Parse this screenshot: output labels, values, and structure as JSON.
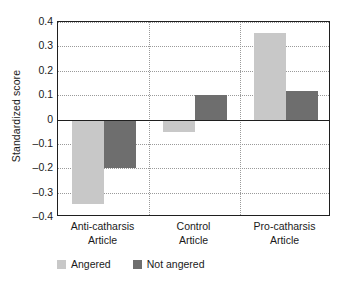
{
  "chart_data": {
    "type": "bar",
    "title": "",
    "xlabel": "",
    "ylabel": "Standardized score",
    "ylim": [
      -0.4,
      0.4
    ],
    "yticks": [
      0.4,
      0.3,
      0.2,
      0.1,
      0,
      -0.1,
      -0.2,
      -0.3,
      -0.4
    ],
    "ytick_labels": [
      "0.4",
      "0.3",
      "0.2",
      "0.1",
      "0",
      "–0.1",
      "–0.2",
      "–0.3",
      "–0.4"
    ],
    "categories": [
      "Anti-catharsis Article",
      "Control Article",
      "Pro-catharsis Article"
    ],
    "category_lines": [
      [
        "Anti-catharsis",
        "Article"
      ],
      [
        "Control",
        "Article"
      ],
      [
        "Pro-catharsis",
        "Article"
      ]
    ],
    "series": [
      {
        "name": "Angered",
        "color": "#c8c8c8",
        "values": [
          -0.345,
          -0.05,
          0.355
        ]
      },
      {
        "name": "Not angered",
        "color": "#6e6e6e",
        "values": [
          -0.2,
          0.1,
          0.115
        ]
      }
    ],
    "grid": true,
    "grid_style": "dotted",
    "group_separators": true,
    "legend_position": "bottom-left",
    "zero_line": 0
  },
  "legend": {
    "items": [
      {
        "label": "Angered",
        "swatch": "light"
      },
      {
        "label": "Not angered",
        "swatch": "dark"
      }
    ]
  },
  "axis": {
    "y_title": "Standardized score"
  }
}
